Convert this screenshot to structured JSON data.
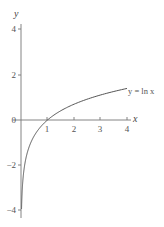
{
  "chart_data": {
    "type": "line",
    "title": "",
    "xlabel": "x",
    "ylabel": "y",
    "xlim": [
      0,
      4.2
    ],
    "ylim": [
      -4.3,
      4.3
    ],
    "grid": false,
    "legend": "none",
    "x_ticks": [
      1,
      2,
      3,
      4
    ],
    "x_tick_labels": [
      "1",
      "2",
      "3",
      "4"
    ],
    "y_ticks": [
      4,
      2,
      0,
      -2,
      -4
    ],
    "y_tick_labels": [
      "4",
      "2",
      "0",
      "−2",
      "−4"
    ],
    "annotations": [
      {
        "text": "y = ln x",
        "x": 4.0,
        "y": 1.386
      }
    ],
    "series": [
      {
        "name": "y = ln x",
        "x": [
          0.02,
          0.05,
          0.1,
          0.2,
          0.3,
          0.5,
          0.75,
          1,
          1.5,
          2,
          2.5,
          3,
          3.5,
          4
        ],
        "y": [
          -3.91,
          -3.0,
          -2.3,
          -1.61,
          -1.2,
          -0.69,
          -0.29,
          0,
          0.41,
          0.69,
          0.92,
          1.1,
          1.25,
          1.39
        ]
      }
    ]
  },
  "labels": {
    "x_axis": "x",
    "y_axis": "y",
    "curve": "y = ln x",
    "x_ticks": [
      "1",
      "2",
      "3",
      "4"
    ],
    "y_ticks": [
      "4",
      "2",
      "0",
      "−2",
      "−4"
    ]
  }
}
